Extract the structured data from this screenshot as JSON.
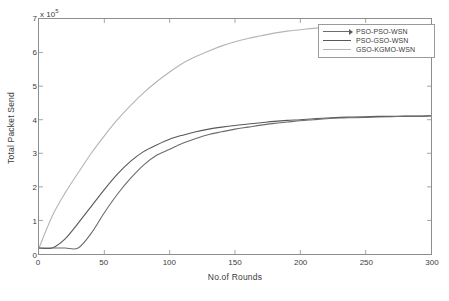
{
  "chart_data": {
    "type": "line",
    "title": "",
    "xlabel": "No.of Rounds",
    "ylabel": "Total Packet Send",
    "y_exponent_label": "x 10",
    "y_exponent_value": "5",
    "xlim": [
      0,
      300
    ],
    "ylim": [
      0,
      7
    ],
    "xticks": [
      0,
      50,
      100,
      150,
      200,
      250,
      300
    ],
    "yticks": [
      0,
      1,
      2,
      3,
      4,
      5,
      6,
      7
    ],
    "xtick_labels": [
      "0",
      "50",
      "100",
      "150",
      "200",
      "250",
      "300"
    ],
    "ytick_labels": [
      "0",
      "1",
      "2",
      "3",
      "4",
      "5",
      "6",
      "7"
    ],
    "grid": false,
    "legend_position": "top-right",
    "y_units": "x10^5 packets",
    "x": [
      0,
      10,
      20,
      30,
      40,
      50,
      60,
      70,
      80,
      90,
      100,
      110,
      120,
      130,
      140,
      150,
      160,
      170,
      180,
      190,
      200,
      210,
      220,
      230,
      240,
      250,
      260,
      270,
      280,
      290,
      300
    ],
    "series": [
      {
        "name": "PSO-PSO-WSN",
        "color": "#6b6b6b",
        "marker": "arrow",
        "values": [
          0.18,
          0.18,
          0.18,
          0.18,
          0.62,
          1.23,
          1.78,
          2.25,
          2.65,
          2.94,
          3.12,
          3.3,
          3.44,
          3.56,
          3.64,
          3.72,
          3.78,
          3.84,
          3.89,
          3.93,
          3.97,
          4.0,
          4.03,
          4.05,
          4.06,
          4.07,
          4.08,
          4.09,
          4.1,
          4.1,
          4.11
        ]
      },
      {
        "name": "PSO-GSO-WSN",
        "color": "#585858",
        "marker": "none",
        "values": [
          0.18,
          0.18,
          0.45,
          0.92,
          1.42,
          1.92,
          2.38,
          2.76,
          3.05,
          3.25,
          3.42,
          3.54,
          3.64,
          3.72,
          3.78,
          3.83,
          3.87,
          3.91,
          3.95,
          3.98,
          4.0,
          4.03,
          4.05,
          4.07,
          4.08,
          4.09,
          4.1,
          4.1,
          4.11,
          4.11,
          4.12
        ]
      },
      {
        "name": "GSO-KGMO-WSN",
        "color": "#b4b4b4",
        "marker": "none",
        "values": [
          0.18,
          1.12,
          1.82,
          2.42,
          3.0,
          3.52,
          4.0,
          4.42,
          4.8,
          5.13,
          5.42,
          5.68,
          5.88,
          6.05,
          6.2,
          6.32,
          6.42,
          6.5,
          6.58,
          6.64,
          6.68,
          6.72,
          6.75,
          6.77,
          6.78,
          6.79,
          6.8,
          6.81,
          6.81,
          6.82,
          6.82
        ]
      }
    ]
  }
}
